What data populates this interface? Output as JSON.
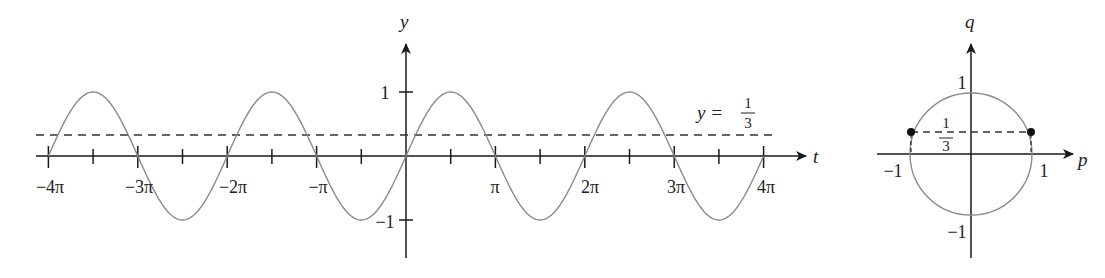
{
  "chart_data": [
    {
      "type": "line",
      "title": "",
      "function": "y = sin(t)",
      "xlabel": "t",
      "ylabel": "y",
      "xlim": [
        -12.566,
        12.566
      ],
      "ylim": [
        -1,
        1
      ],
      "x_tick_labels": [
        "−4π",
        "−3π",
        "−2π",
        "−π",
        "π",
        "2π",
        "3π",
        "4π"
      ],
      "x_tick_values": [
        -12.566,
        -9.425,
        -6.283,
        -3.142,
        3.142,
        6.283,
        9.425,
        12.566
      ],
      "x_minor_ticks": "every π/2",
      "y_tick_labels": [
        "1",
        "−1"
      ],
      "y_tick_values": [
        1,
        -1
      ],
      "series": [
        {
          "name": "sin(t)",
          "style": "solid gray curve",
          "x_range": [
            -12.566,
            12.566
          ]
        },
        {
          "name": "y = 1/3",
          "style": "dashed horizontal line",
          "value": 0.3333
        }
      ],
      "annotations": [
        {
          "text": "y = 1/3",
          "position": "right, above dashed line"
        }
      ],
      "grid": false
    },
    {
      "type": "scatter",
      "title": "",
      "description": "Unit circle p² + q² = 1 with line q = 1/3",
      "xlabel": "p",
      "ylabel": "q",
      "xlim": [
        -1,
        1
      ],
      "ylim": [
        -1,
        1
      ],
      "x_tick_labels": [
        "−1",
        "1"
      ],
      "y_tick_labels": [
        "1",
        "−1"
      ],
      "points": [
        {
          "p": -0.9428,
          "q": 0.3333
        },
        {
          "p": 0.9428,
          "q": 0.3333
        }
      ],
      "annotations": [
        {
          "text": "1/3",
          "position": "above origin, left of q-axis"
        }
      ],
      "grid": false
    }
  ],
  "labels": {
    "left": {
      "t_axis": "t",
      "y_axis": "y",
      "x_ticks": [
        "−4π",
        "−3π",
        "−2π",
        "−π",
        "π",
        "2π",
        "3π",
        "4π"
      ],
      "y_tick_pos": "1",
      "y_tick_neg": "−1",
      "hline_label_lhs": "y =",
      "hline_num": "1",
      "hline_den": "3"
    },
    "right": {
      "p_axis": "p",
      "q_axis": "q",
      "p_neg": "−1",
      "p_pos": "1",
      "q_pos": "1",
      "q_neg": "−1",
      "frac_num": "1",
      "frac_den": "3"
    }
  },
  "colors": {
    "axis": "#1a1a1a",
    "curve": "#8a8a8a",
    "dashed": "#333333",
    "points": "#111111"
  }
}
